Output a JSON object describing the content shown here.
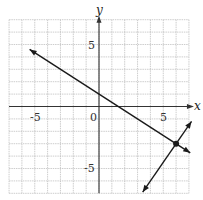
{
  "chart_data": {
    "type": "line",
    "title": "",
    "xlabel": "x",
    "ylabel": "y",
    "xlim": [
      -7,
      7
    ],
    "ylim": [
      -7,
      7
    ],
    "grid": true,
    "tick_labels": {
      "x": [
        {
          "value": -5,
          "label": "-5"
        },
        {
          "value": 0,
          "label": "0"
        },
        {
          "value": 5,
          "label": "5"
        }
      ],
      "y": [
        {
          "value": 5,
          "label": "5"
        },
        {
          "value": -5,
          "label": "-5"
        }
      ]
    },
    "series": [
      {
        "name": "line-1",
        "equation": "y = -2/3 x + 1",
        "slope": -0.6667,
        "intercept": 1,
        "x_range": [
          -5.4,
          7.1
        ],
        "arrows": "both"
      },
      {
        "name": "line-2",
        "equation": "y = 3/2 x - 12",
        "slope": 1.5,
        "intercept": -12,
        "x_range": [
          3.4,
          7.2
        ],
        "arrows": "both"
      }
    ],
    "points": [
      {
        "x": 6,
        "y": -3,
        "label": "intersection"
      }
    ]
  },
  "labels": {
    "x_axis": "x",
    "y_axis": "y",
    "x_neg5": "-5",
    "x_zero": "0",
    "x_pos5": "5",
    "y_pos5": "5",
    "y_neg5": "-5"
  },
  "colors": {
    "grid": "#b8b8b8",
    "axis": "#333333",
    "line": "#1a1a1a"
  }
}
